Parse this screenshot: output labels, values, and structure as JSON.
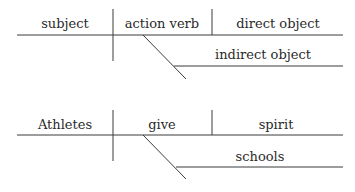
{
  "diagrams": [
    {
      "name": "template",
      "subject": "subject",
      "verb": "action verb",
      "direct_object": "direct object",
      "indirect_object": "indirect object"
    },
    {
      "name": "example",
      "subject": "Athletes",
      "verb": "give",
      "direct_object": "spirit",
      "indirect_object": "schools"
    }
  ],
  "colors": {
    "line": "#3a3a3a",
    "text": "#2a2a2a",
    "background": "#ffffff"
  }
}
